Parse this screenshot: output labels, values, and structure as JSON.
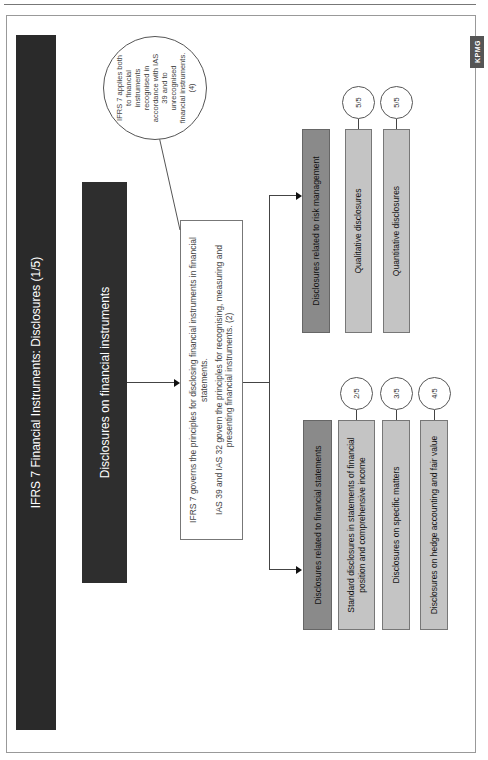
{
  "page": {
    "side_tab": "KPMG"
  },
  "diagram": {
    "title": "IFRS 7 Financial Instruments: Disclosures (1/5)",
    "main_box": "Disclosures on financial instruments",
    "description": {
      "line1": "IFRS 7 governs the principles for disclosing financial instruments in financial statements.",
      "line2": "IAS 39 and IAS 32 govern the principles for recognising, measuring and presenting financial instruments. (2)"
    },
    "callout": "IFRS 7 applies both to financial instruments recognised in accordance with IAS 39 and to unrecognised financial instruments. (4)",
    "branches": [
      {
        "label": "Disclosures related to financial statements",
        "items": [
          {
            "label": "Standard disclosures in statements of financial position and comprehensive income",
            "page": "2/5"
          },
          {
            "label": "Disclosures on specific matters",
            "page": "3/5"
          },
          {
            "label": "Disclosures on hedge accounting and fair value",
            "page": "4/5"
          }
        ]
      },
      {
        "label": "Disclosures related to risk management",
        "items": [
          {
            "label": "Qualitative disclosures",
            "page": "5/5"
          },
          {
            "label": "Quantitative disclosures",
            "page": "5/5"
          }
        ]
      }
    ]
  }
}
